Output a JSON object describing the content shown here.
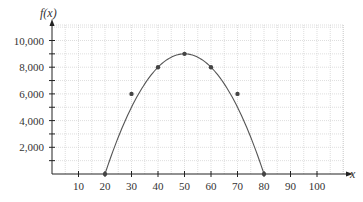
{
  "chart_data": {
    "type": "line",
    "title": "",
    "xlabel": "x",
    "ylabel": "f(x)",
    "x_ticks": [
      10,
      20,
      30,
      40,
      50,
      60,
      70,
      80,
      90,
      100
    ],
    "x_tick_labels": [
      "10",
      "20",
      "30",
      "40",
      "50",
      "60",
      "70",
      "80",
      "90",
      "100"
    ],
    "y_ticks": [
      2000,
      4000,
      6000,
      8000,
      10000
    ],
    "y_tick_labels": [
      "2,000",
      "4,000",
      "6,000",
      "8,000",
      "10,000"
    ],
    "xlim": [
      0,
      110
    ],
    "ylim": [
      0,
      11000
    ],
    "grid": true,
    "legend": null,
    "series": [
      {
        "name": "f(x)",
        "x": [
          20,
          30,
          40,
          50,
          60,
          70,
          80
        ],
        "values": [
          0,
          6000,
          8000,
          9000,
          8000,
          6000,
          0
        ],
        "markers": true,
        "color": "#555555"
      }
    ]
  },
  "colors": {
    "axis": "#222222",
    "grid": "#c8c8c8",
    "curve": "#555555",
    "point": "#444444"
  }
}
